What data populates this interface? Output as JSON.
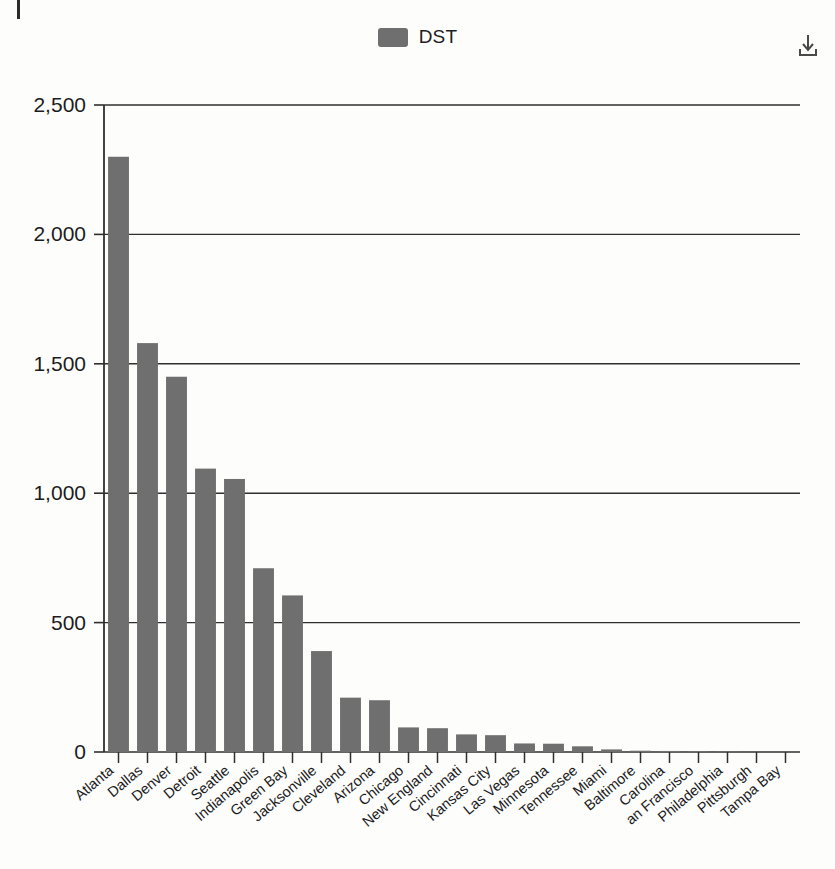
{
  "legend": {
    "series_label": "DST",
    "swatch_color": "#6f6f6f"
  },
  "toolbar": {
    "download_icon_name": "download-icon",
    "download_tooltip": "Download"
  },
  "chart_data": {
    "type": "bar",
    "title": "",
    "subtitle": "",
    "xlabel": "",
    "ylabel": "",
    "ylim": [
      0,
      2500
    ],
    "yticks": [
      0,
      500,
      1000,
      1500,
      2000,
      2500
    ],
    "ytick_labels": [
      "0",
      "500",
      "1,000",
      "1,500",
      "2,000",
      "2,500"
    ],
    "grid": true,
    "legend_position": "top-center",
    "bar_color": "#6f6f6f",
    "categories": [
      "Atlanta",
      "Dallas",
      "Denver",
      "Detroit",
      "Seattle",
      "Indianapolis",
      "Green Bay",
      "Jacksonville",
      "Cleveland",
      "Arizona",
      "Chicago",
      "New England",
      "Cincinnati",
      "Kansas City",
      "Las Vegas",
      "Minnesota",
      "Tennessee",
      "Miami",
      "Baltimore",
      "Carolina",
      "an Francisco",
      "Philadelphia",
      "Pittsburgh",
      "Tampa Bay"
    ],
    "series": [
      {
        "name": "DST",
        "values": [
          2300,
          1580,
          1450,
          1095,
          1055,
          710,
          605,
          390,
          210,
          200,
          95,
          92,
          68,
          65,
          33,
          32,
          22,
          10,
          5,
          4,
          3,
          2,
          1,
          1
        ]
      }
    ]
  }
}
